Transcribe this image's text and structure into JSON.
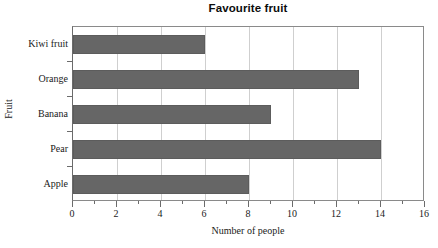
{
  "chart_data": {
    "type": "bar",
    "orientation": "horizontal",
    "title": "Favourite fruit",
    "xlabel": "Number of people",
    "ylabel": "Fruit",
    "categories": [
      "Apple",
      "Pear",
      "Banana",
      "Orange",
      "Kiwi fruit"
    ],
    "values": [
      8,
      14,
      9,
      13,
      6
    ],
    "xlim": [
      0,
      16
    ],
    "xticks": [
      0,
      2,
      4,
      6,
      8,
      10,
      12,
      14,
      16
    ],
    "xtick_labels": [
      "0",
      "2",
      "4",
      "6",
      "8",
      "10",
      "12",
      "14",
      "16"
    ],
    "minor_xticks": [
      1,
      3,
      5,
      7,
      9,
      11,
      13,
      15
    ],
    "grid": true,
    "gridlines_at": [
      2,
      4,
      6,
      8,
      10,
      12,
      14
    ],
    "legend": null,
    "bar_color": "#666666",
    "gridline_color": "#cfcfcf",
    "axis_color": "#6b6b6b",
    "background_color": "#ffffff"
  }
}
